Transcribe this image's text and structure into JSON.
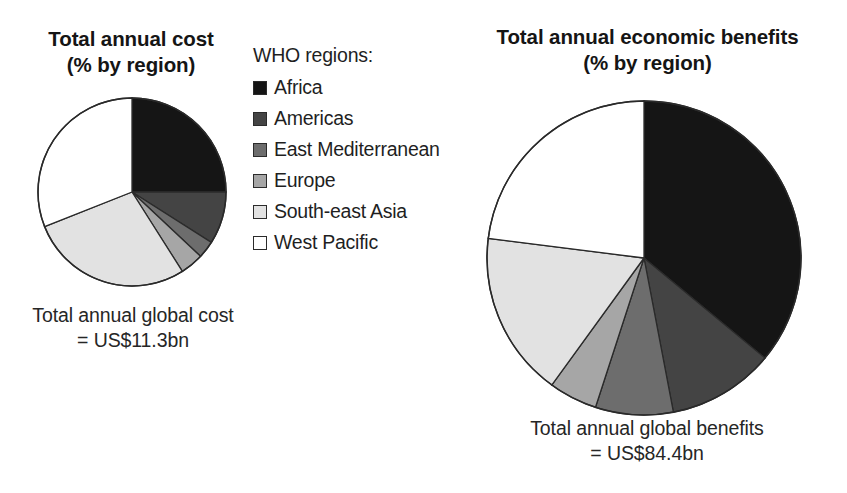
{
  "legend": {
    "title": "WHO regions:",
    "items": [
      {
        "label": "Africa",
        "color": "#151515"
      },
      {
        "label": "Americas",
        "color": "#444444"
      },
      {
        "label": "East Mediterranean",
        "color": "#6d6d6d"
      },
      {
        "label": "Europe",
        "color": "#a6a6a6"
      },
      {
        "label": "South-east Asia",
        "color": "#e2e2e2"
      },
      {
        "label": "West Pacific",
        "color": "#ffffff"
      }
    ]
  },
  "left": {
    "title_line1": "Total annual cost",
    "title_line2": "(% by region)",
    "caption_line1": "Total annual global cost",
    "caption_line2": "= US$11.3bn"
  },
  "right": {
    "title_line1": "Total annual economic benefits",
    "title_line2": "(% by region)",
    "caption_line1": "Total annual global benefits",
    "caption_line2": "= US$84.4bn"
  },
  "chart_data": [
    {
      "type": "pie",
      "title": "Total annual cost (% by region)",
      "subtitle": "Total annual global cost = US$11.3bn",
      "total_label": "= US$11.3bn",
      "total_value": 11.3,
      "total_units": "US$ billion",
      "legend_title": "WHO regions:",
      "legend_position": "center",
      "start_angle_deg": 0,
      "direction": "clockwise",
      "categories": [
        "Africa",
        "Americas",
        "East Mediterranean",
        "Europe",
        "South-east Asia",
        "West Pacific"
      ],
      "values": [
        25,
        9,
        3,
        4,
        28,
        31
      ],
      "colors": [
        "#151515",
        "#444444",
        "#6d6d6d",
        "#a6a6a6",
        "#e2e2e2",
        "#ffffff"
      ],
      "value_units": "percent"
    },
    {
      "type": "pie",
      "title": "Total annual economic benefits (% by region)",
      "subtitle": "Total annual global benefits = US$84.4bn",
      "total_label": "= US$84.4bn",
      "total_value": 84.4,
      "total_units": "US$ billion",
      "legend_title": "WHO regions:",
      "legend_position": "center",
      "start_angle_deg": 0,
      "direction": "clockwise",
      "categories": [
        "Africa",
        "Americas",
        "East Mediterranean",
        "Europe",
        "South-east Asia",
        "West Pacific"
      ],
      "values": [
        36,
        11,
        8,
        5,
        17,
        23
      ],
      "colors": [
        "#151515",
        "#444444",
        "#6d6d6d",
        "#a6a6a6",
        "#e2e2e2",
        "#ffffff"
      ],
      "value_units": "percent"
    }
  ]
}
